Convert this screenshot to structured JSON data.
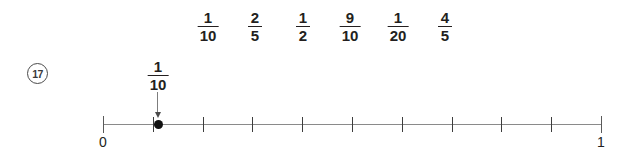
{
  "question": {
    "number_label": "17",
    "number_glyph": "⑧"
  },
  "option_bank": {
    "items": [
      {
        "numerator": "1",
        "denominator": "10",
        "x": 208
      },
      {
        "numerator": "2",
        "denominator": "5",
        "x": 255
      },
      {
        "numerator": "1",
        "denominator": "2",
        "x": 303
      },
      {
        "numerator": "9",
        "denominator": "10",
        "x": 350
      },
      {
        "numerator": "1",
        "denominator": "20",
        "x": 398
      },
      {
        "numerator": "4",
        "denominator": "5",
        "x": 445
      }
    ]
  },
  "pointer": {
    "label": {
      "numerator": "1",
      "denominator": "10"
    },
    "target_x": 158
  },
  "number_line": {
    "start_label": "0",
    "end_label": "1",
    "start_x": 103,
    "end_x": 601,
    "tick_count": 11,
    "marker_value": "1/10",
    "marker_x": 158
  },
  "colors": {
    "text": "#231f20",
    "axis": "#8a8a8a",
    "tick": "#3d3d3d",
    "marker": "#111111",
    "arrow": "#7d7d7d",
    "background": "#ffffff"
  }
}
